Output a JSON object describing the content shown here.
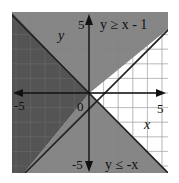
{
  "chart_data": {
    "type": "area",
    "title": "",
    "xlabel": "x",
    "ylabel": "y",
    "xlim": [
      -5.3,
      5.4
    ],
    "ylim": [
      -5.5,
      5.5
    ],
    "grid": true,
    "ticks": {
      "x": [
        "-5",
        "0",
        "5"
      ],
      "y": [
        "5",
        "-5"
      ]
    },
    "inequalities": [
      {
        "label": "y ≥ x - 1",
        "boundary": {
          "slope": 1,
          "intercept": -1
        },
        "shade": "above",
        "line_style": "solid"
      },
      {
        "label": "y ≤ -x",
        "boundary": {
          "slope": -1,
          "intercept": 0
        },
        "shade": "below",
        "line_style": "solid"
      }
    ],
    "regions": [
      {
        "name": "both",
        "description": "overlap of both inequalities (left wedge)",
        "color": "#4b4b4b"
      },
      {
        "name": "single",
        "description": "satisfies only one inequality (top and bottom wedges)",
        "color": "#7c7c7c"
      },
      {
        "name": "none",
        "description": "satisfies neither (right wedge)",
        "color": "#ffffff"
      }
    ],
    "annotations": [
      {
        "text": "y ≥ x - 1",
        "position": "top-right"
      },
      {
        "text": "y ≤ -x",
        "position": "bottom-right"
      }
    ]
  },
  "labels": {
    "x_axis": "x",
    "y_axis": "y",
    "tick_x_neg": "-5",
    "tick_x_pos": "5",
    "tick_y_pos": "5",
    "tick_y_neg": "-5",
    "origin": "0",
    "ineq1": "y ≥ x - 1",
    "ineq2": "y ≤ -x"
  },
  "colors": {
    "dark": "#4b4b4b",
    "medium": "#7c7c7c",
    "grid_light": "#c8c8c8",
    "axis": "#111111"
  }
}
